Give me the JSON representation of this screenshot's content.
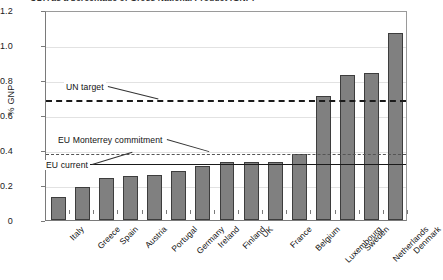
{
  "chart_data": {
    "type": "bar",
    "title": "ODA as a percentage of Gross National Product (GNP)",
    "xlabel": "",
    "ylabel": "% GNP",
    "ylim": [
      0,
      1.2
    ],
    "yticks": [
      "0",
      "0.2",
      "0.4",
      "0.6",
      "0.8",
      "1.0",
      "1.2"
    ],
    "ytick_values": [
      0,
      0.2,
      0.4,
      0.6,
      0.8,
      1.0,
      1.2
    ],
    "grid": true,
    "legend": "none",
    "categories": [
      "Italy",
      "Greece",
      "Spain",
      "Austria",
      "Portugal",
      "Germany",
      "Ireland",
      "Finland",
      "UK",
      "France",
      "Belgium",
      "Luxembourg",
      "Sweden",
      "Netherlands",
      "Denmark"
    ],
    "values": [
      0.13,
      0.19,
      0.24,
      0.25,
      0.26,
      0.28,
      0.31,
      0.33,
      0.33,
      0.33,
      0.38,
      0.71,
      0.83,
      0.84,
      1.07
    ],
    "series": [
      {
        "name": "ODA % of GNP",
        "values": [
          0.13,
          0.19,
          0.24,
          0.25,
          0.26,
          0.28,
          0.31,
          0.33,
          0.33,
          0.33,
          0.38,
          0.71,
          0.83,
          0.84,
          1.07
        ],
        "color": "#808080"
      }
    ],
    "reference_lines": [
      {
        "label": "UN target",
        "value": 0.7,
        "style": "dashed-heavy"
      },
      {
        "label": "EU Monterrey commitment",
        "value": 0.39,
        "style": "dashed-light"
      },
      {
        "label": "EU current",
        "value": 0.33,
        "style": "solid"
      }
    ],
    "annotations": [
      {
        "text": "UN target",
        "value": 0.7
      },
      {
        "text": "EU Monterrey commitment",
        "value": 0.39
      },
      {
        "text": "EU current",
        "value": 0.33
      }
    ]
  }
}
